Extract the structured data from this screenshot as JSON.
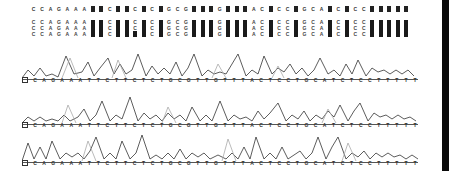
{
  "figure": {
    "consensus": [
      "C",
      "C",
      "A",
      "G",
      "A",
      "A",
      "A",
      "■",
      "■",
      "C",
      "■",
      "■",
      "C",
      "■",
      "C",
      "■",
      "G",
      "C",
      "G",
      "■",
      "■",
      "■",
      "G",
      "■",
      "■",
      "■",
      "A",
      "C",
      "■",
      "C",
      "C",
      "■",
      "G",
      "C",
      "A",
      "■",
      "C",
      "■",
      "C",
      "C",
      "■",
      "■",
      "■",
      "■",
      "■"
    ],
    "alignment": [
      [
        "C",
        "C",
        "C"
      ],
      [
        "C",
        "C",
        "C"
      ],
      [
        "A",
        "A",
        "A"
      ],
      [
        "G",
        "G",
        "G"
      ],
      [
        "A",
        "A",
        "A"
      ],
      [
        "A",
        "A",
        "A"
      ],
      [
        "A",
        "A",
        "A"
      ],
      [
        "■"
      ],
      [
        "■"
      ],
      [
        "C",
        "C",
        "C"
      ],
      [
        "■"
      ],
      [
        "■"
      ],
      [
        "C",
        "C",
        "■"
      ],
      [
        "■"
      ],
      [
        "C",
        "C",
        "C"
      ],
      [
        "■"
      ],
      [
        "G",
        "G",
        "G"
      ],
      [
        "C",
        "C",
        "C"
      ],
      [
        "G",
        "G",
        "G"
      ],
      [
        "■"
      ],
      [
        "■"
      ],
      [
        "■"
      ],
      [
        "G",
        "G",
        "G"
      ],
      [
        "■"
      ],
      [
        "■"
      ],
      [
        "■"
      ],
      [
        "A",
        "A",
        "A"
      ],
      [
        "C",
        "C",
        "C"
      ],
      [
        "■"
      ],
      [
        "C",
        "C",
        "C"
      ],
      [
        "C",
        "C",
        "C"
      ],
      [
        "■"
      ],
      [
        "G",
        "G",
        "G"
      ],
      [
        "C",
        "C",
        "C"
      ],
      [
        "A",
        "A",
        "A"
      ],
      [
        "■"
      ],
      [
        "C",
        "C",
        "C"
      ],
      [
        "■"
      ],
      [
        "C",
        "C",
        "C"
      ],
      [
        "C",
        "C",
        "C"
      ],
      [
        "■"
      ],
      [
        "■"
      ],
      [
        "■"
      ],
      [
        "■"
      ],
      [
        "■"
      ]
    ],
    "traces": [
      {
        "label": "trace-1",
        "sequence": [
          "C",
          "A",
          "G",
          "A",
          "A",
          "A",
          "T",
          "T",
          "C",
          "T",
          "T",
          "C",
          "T",
          "C",
          "T",
          "G",
          "C",
          "G",
          "T",
          "T",
          "G",
          "T",
          "T",
          "T",
          "A",
          "C",
          "T",
          "C",
          "C",
          "T",
          "G",
          "C",
          "A",
          "T",
          "C",
          "T",
          "C",
          "C",
          "T",
          "T",
          "T",
          "T",
          "T"
        ]
      },
      {
        "label": "trace-2",
        "sequence": [
          "C",
          "A",
          "G",
          "A",
          "A",
          "A",
          "T",
          "T",
          "C",
          "T",
          "T",
          "C",
          "T",
          "C",
          "T",
          "G",
          "C",
          "G",
          "T",
          "T",
          "G",
          "T",
          "T",
          "T",
          "A",
          "C",
          "T",
          "C",
          "C",
          "T",
          "G",
          "C",
          "A",
          "T",
          "C",
          "T",
          "C",
          "C",
          "T",
          "T",
          "T",
          "T",
          "T"
        ]
      },
      {
        "label": "trace-3",
        "sequence": [
          "C",
          "A",
          "G",
          "A",
          "A",
          "A",
          "T",
          "T",
          "C",
          "T",
          "T",
          "C",
          "T",
          "C",
          "T",
          "G",
          "C",
          "G",
          "T",
          "T",
          "G",
          "T",
          "T",
          "T",
          "A",
          "C",
          "T",
          "C",
          "C",
          "T",
          "G",
          "C",
          "A",
          "T",
          "C",
          "T",
          "C",
          "C",
          "T",
          "T",
          "T",
          "T",
          "T"
        ]
      }
    ],
    "colors": {
      "trace_dark": "#333333",
      "trace_light": "#aaaaaa",
      "block": "#1a1a1a",
      "right_bar": "#0a0a0a"
    }
  }
}
